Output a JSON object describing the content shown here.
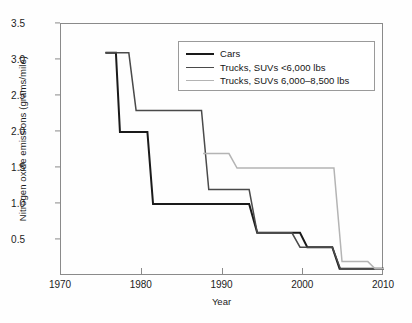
{
  "chart_data": {
    "type": "line",
    "title": "",
    "xlabel": "Year",
    "ylabel": "Nitrogen oxide emissions (grams/mile)",
    "xlim": [
      1970,
      2010
    ],
    "ylim": [
      0.0,
      3.5
    ],
    "xticks": [
      "1970",
      "1980",
      "1990",
      "2000",
      "2010"
    ],
    "xtick_values": [
      1970,
      1980,
      1990,
      2000,
      2010
    ],
    "yticks": [
      "0.5",
      "1.0",
      "1.5",
      "2.0",
      "2.5",
      "3.0",
      "3.5"
    ],
    "ytick_values": [
      0.5,
      1.0,
      1.5,
      2.0,
      2.5,
      3.0,
      3.5
    ],
    "grid": false,
    "legend_position": "upper right",
    "series": [
      {
        "name": "Cars",
        "color": "#1a1a1a",
        "width": 2.0,
        "style": "step-like",
        "points": [
          [
            1975.5,
            3.1
          ],
          [
            1976.8,
            3.1
          ],
          [
            1977.3,
            2.0
          ],
          [
            1980.7,
            2.0
          ],
          [
            1981.4,
            1.0
          ],
          [
            1993.3,
            1.0
          ],
          [
            1994.3,
            0.6
          ],
          [
            1999.6,
            0.6
          ],
          [
            2000.5,
            0.4
          ],
          [
            2003.6,
            0.4
          ],
          [
            2004.5,
            0.1
          ],
          [
            2010,
            0.1
          ]
        ]
      },
      {
        "name": "Trucks, SUVs <6,000 lbs",
        "color": "#4a4a4a",
        "width": 1.5,
        "style": "step-like",
        "points": [
          [
            1975.5,
            3.1
          ],
          [
            1978.4,
            3.1
          ],
          [
            1979.3,
            2.3
          ],
          [
            1987.4,
            2.3
          ],
          [
            1988.3,
            1.2
          ],
          [
            1993.3,
            1.2
          ],
          [
            1994.3,
            0.6
          ],
          [
            1998.6,
            0.6
          ],
          [
            1999.6,
            0.4
          ],
          [
            2003.6,
            0.4
          ],
          [
            2004.6,
            0.1
          ],
          [
            2010,
            0.1
          ]
        ]
      },
      {
        "name": "Trucks, SUVs 6,000–8,500 lbs",
        "color": "#b4b4b4",
        "width": 1.5,
        "style": "step-like",
        "points": [
          [
            1987.6,
            1.7
          ],
          [
            1990.8,
            1.7
          ],
          [
            1991.8,
            1.5
          ],
          [
            2003.8,
            1.5
          ],
          [
            2004.8,
            0.2
          ],
          [
            2008.0,
            0.2
          ],
          [
            2008.9,
            0.1
          ],
          [
            2010,
            0.1
          ]
        ]
      }
    ],
    "annotations": []
  },
  "legend": {
    "entries": [
      {
        "label": "Cars"
      },
      {
        "label": "Trucks, SUVs <6,000 lbs"
      },
      {
        "label": "Trucks, SUVs 6,000–8,500 lbs"
      }
    ]
  }
}
